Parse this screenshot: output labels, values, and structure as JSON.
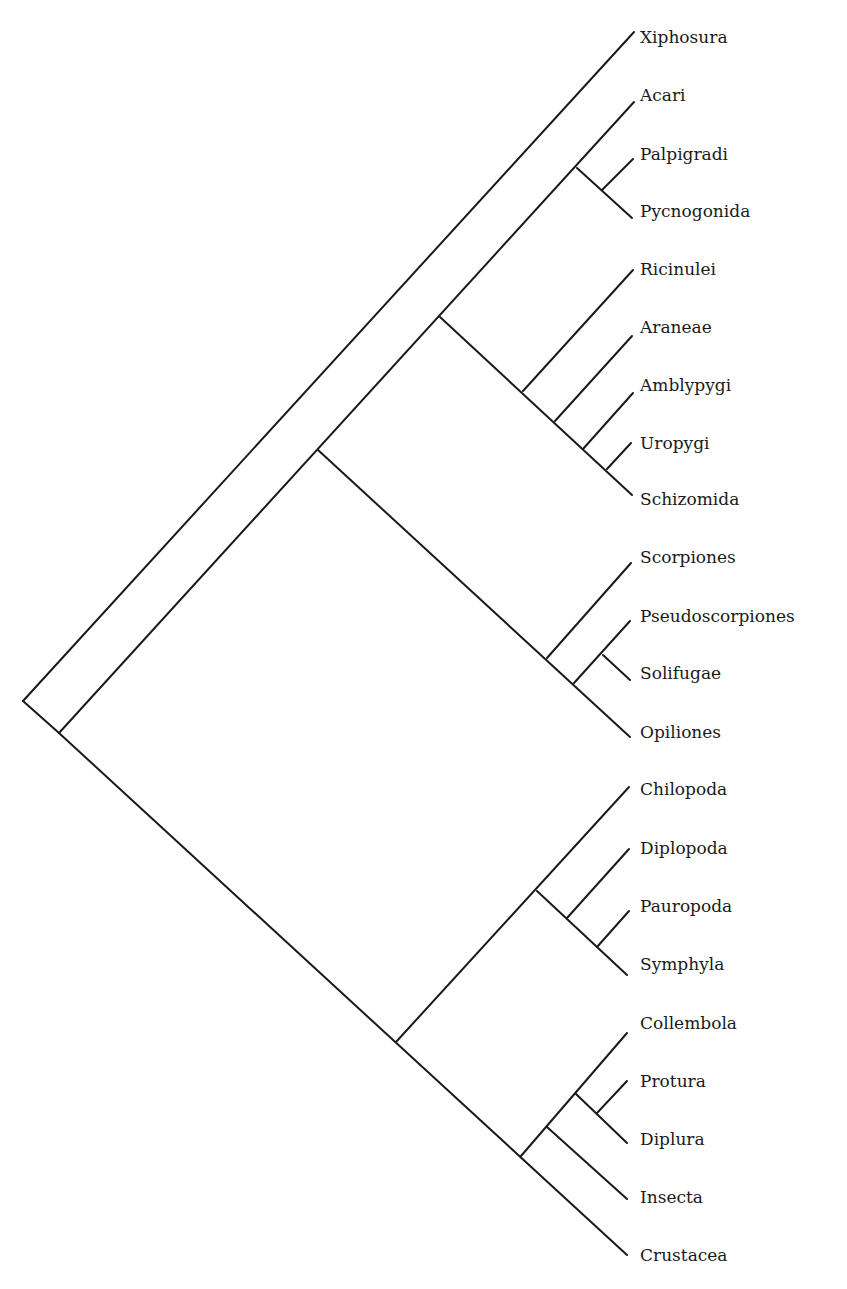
{
  "diagram": {
    "type": "cladogram",
    "orientation": "root-left, tips-right, diagonal branches",
    "line_color": "#1a1a1a",
    "background": "#ffffff"
  },
  "taxa": [
    {
      "id": "xiphosura",
      "label": "Xiphosura",
      "y": 38
    },
    {
      "id": "acari",
      "label": "Acari",
      "y": 96
    },
    {
      "id": "palpigradi",
      "label": "Palpigradi",
      "y": 155
    },
    {
      "id": "pycnogonida",
      "label": "Pycnogonida",
      "y": 212
    },
    {
      "id": "ricinulei",
      "label": "Ricinulei",
      "y": 270
    },
    {
      "id": "araneae",
      "label": "Araneae",
      "y": 328
    },
    {
      "id": "amblypygi",
      "label": "Amblypygi",
      "y": 386
    },
    {
      "id": "uropygi",
      "label": "Uropygi",
      "y": 444
    },
    {
      "id": "schizomida",
      "label": "Schizomida",
      "y": 500
    },
    {
      "id": "scorpiones",
      "label": "Scorpiones",
      "y": 558
    },
    {
      "id": "pseudoscorpiones",
      "label": "Pseudoscorpiones",
      "y": 617
    },
    {
      "id": "solifugae",
      "label": "Solifugae",
      "y": 674
    },
    {
      "id": "opiliones",
      "label": "Opiliones",
      "y": 733
    },
    {
      "id": "chilopoda",
      "label": "Chilopoda",
      "y": 790
    },
    {
      "id": "diplopoda",
      "label": "Diplopoda",
      "y": 849
    },
    {
      "id": "pauropoda",
      "label": "Pauropoda",
      "y": 907
    },
    {
      "id": "symphyla",
      "label": "Symphyla",
      "y": 965
    },
    {
      "id": "collembola",
      "label": "Collembola",
      "y": 1024
    },
    {
      "id": "protura",
      "label": "Protura",
      "y": 1082
    },
    {
      "id": "diplura",
      "label": "Diplura",
      "y": 1140
    },
    {
      "id": "insecta",
      "label": "Insecta",
      "y": 1198
    },
    {
      "id": "crustacea",
      "label": "Crustacea",
      "y": 1256
    }
  ],
  "topology": "(Xiphosura,((Acari,(Palpigradi,Pycnogonida)),(Ricinulei,(Araneae,(Amblypygi,(Uropygi,Schizomida)))),(Scorpiones,((Pseudoscorpiones,Solifugae),Opiliones))),((Chilopoda,(Diplopoda,(Pauropoda,Symphyla))),((Collembola,(Protura,Diplura)),Insecta),Crustacea))"
}
